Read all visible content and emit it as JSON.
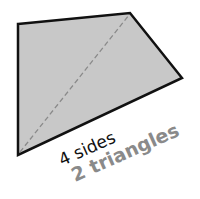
{
  "diagram": {
    "shape": "quadrilateral",
    "fill": "#c8c8c8",
    "stroke": "#111111",
    "vertices": [
      [
        18,
        24
      ],
      [
        130,
        13
      ],
      [
        182,
        78
      ],
      [
        18,
        155
      ]
    ],
    "diagonal": {
      "from": [
        18,
        155
      ],
      "to": [
        130,
        13
      ],
      "color": "#8a8a8a",
      "style": "dashed"
    },
    "labels": {
      "sides": "4 sides",
      "triangles": "2 triangles"
    },
    "colors": {
      "sides_text": "#111111",
      "triangles_text": "#8a8a8a"
    }
  }
}
